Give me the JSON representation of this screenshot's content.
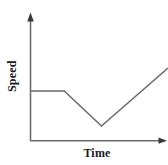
{
  "figure": {
    "background_color": "#ffffff",
    "width": 168,
    "height": 165
  },
  "axes": {
    "x_axis_label": "Time",
    "y_axis_label": "Speed",
    "axis_color": "#6b6b6b",
    "x_axis_has_arrow": true,
    "y_axis_has_arrow": true,
    "x_tick_labels": [],
    "y_tick_labels": [],
    "grid": false
  },
  "chart_data": {
    "type": "line",
    "title": "",
    "subtitle": "",
    "xlabel": "Time",
    "ylabel": "Speed",
    "grid": false,
    "legend": null,
    "legend_position": null,
    "axis_arrows": true,
    "tick_labels_shown": false,
    "xlim": [
      0,
      100
    ],
    "ylim": [
      0,
      100
    ],
    "series": [
      {
        "name": "speed",
        "color": "#6b6b6b",
        "line_width": 1.5,
        "x": [
          0,
          24.8,
          51.8,
          100
        ],
        "y": [
          39.4,
          39.4,
          11.8,
          57.5
        ],
        "segments": [
          {
            "label": "constant speed",
            "shape": "flat"
          },
          {
            "label": "decelerating",
            "shape": "decreasing"
          },
          {
            "label": "accelerating",
            "shape": "increasing"
          }
        ]
      }
    ],
    "annotations": []
  }
}
